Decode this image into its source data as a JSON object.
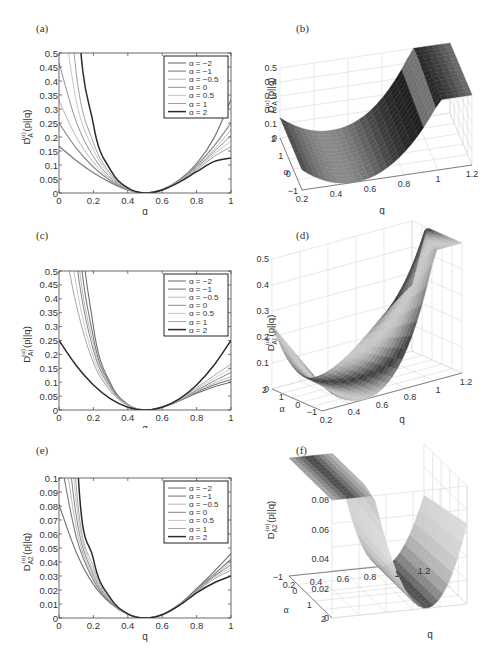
{
  "panels": {
    "a": {
      "label": "(a)",
      "ylabel_main": "D",
      "ylabel_sub": "A",
      "ylabel_sup": "(α)",
      "ylabel_tail": "(p||q)",
      "xlabel": "q"
    },
    "b": {
      "label": "(b)",
      "zlabel_main": "D",
      "zlabel_sub": "A",
      "zlabel_sup": "(α)",
      "zlabel_tail": "(p||q)",
      "xlabel": "q",
      "ylabel": "α"
    },
    "c": {
      "label": "(c)",
      "ylabel_main": "D",
      "ylabel_sub": "AI",
      "ylabel_sup": "(α)",
      "ylabel_tail": "(p||q)",
      "xlabel": "q"
    },
    "d": {
      "label": "(d)",
      "zlabel_main": "D",
      "zlabel_sub": "AI",
      "zlabel_sup": "(α)",
      "zlabel_tail": "(p||q)",
      "xlabel": "q",
      "ylabel": "α"
    },
    "e": {
      "label": "(e)",
      "ylabel_main": "D",
      "ylabel_sub": "A2",
      "ylabel_sup": "(α)",
      "ylabel_tail": "(p||q)",
      "xlabel": "q"
    },
    "f": {
      "label": "(f)",
      "zlabel_main": "D",
      "zlabel_sub": "A2",
      "zlabel_sup": "(α)",
      "zlabel_tail": "(p||q)",
      "xlabel": "q",
      "ylabel": "α"
    }
  },
  "chart_data": [
    {
      "id": "a",
      "type": "line",
      "title": "(a)",
      "xlabel": "q",
      "ylabel": "D_A^(α)(p||q)",
      "xlim": [
        0,
        1
      ],
      "ylim": [
        0,
        0.5
      ],
      "xticks": [
        "0",
        "0.2",
        "0.4",
        "0.6",
        "0.8",
        "1"
      ],
      "yticks": [
        "0",
        "0.05",
        "0.1",
        "0.15",
        "0.2",
        "0.25",
        "0.3",
        "0.35",
        "0.4",
        "0.45",
        "0.5"
      ],
      "grid": false,
      "legend_position": "upper right",
      "x": [
        0,
        0.1,
        0.2,
        0.3,
        0.4,
        0.5,
        0.6,
        0.7,
        0.8,
        0.9,
        1.0
      ],
      "series": [
        {
          "name": "α = −2",
          "color": "#7a7a7a",
          "width": 1.2,
          "values": [
            0.167,
            0.116,
            0.072,
            0.037,
            0.011,
            0,
            0.012,
            0.047,
            0.105,
            0.195,
            0.333
          ]
        },
        {
          "name": "α = −1",
          "color": "#8a8a8a",
          "width": 1.2,
          "values": [
            0.25,
            0.16,
            0.093,
            0.044,
            0.012,
            0,
            0.012,
            0.045,
            0.098,
            0.167,
            0.25
          ]
        },
        {
          "name": "α = −0.5",
          "color": "#b5b5b5",
          "width": 1.0,
          "values": [
            0.33,
            0.2,
            0.11,
            0.05,
            0.013,
            0,
            0.012,
            0.044,
            0.094,
            0.155,
            0.225
          ]
        },
        {
          "name": "α = 0",
          "color": "#8f8f8f",
          "width": 1.0,
          "values": [
            0.465,
            0.255,
            0.13,
            0.055,
            0.014,
            0,
            0.012,
            0.043,
            0.09,
            0.147,
            0.205
          ]
        },
        {
          "name": "α = 0.5",
          "color": "#c4c4c4",
          "width": 1.0,
          "values": [
            0.75,
            0.33,
            0.155,
            0.062,
            0.015,
            0,
            0.012,
            0.042,
            0.086,
            0.139,
            0.185
          ]
        },
        {
          "name": "α = 1",
          "color": "#9e9e9e",
          "width": 1.0,
          "values": [
            1.2,
            0.43,
            0.18,
            0.068,
            0.016,
            0,
            0.011,
            0.041,
            0.082,
            0.13,
            0.165
          ]
        },
        {
          "name": "α = 2",
          "color": "#2a2a2a",
          "width": 1.5,
          "values": [
            3.0,
            0.78,
            0.245,
            0.082,
            0.018,
            0,
            0.011,
            0.039,
            0.076,
            0.112,
            0.125
          ]
        }
      ]
    },
    {
      "id": "b",
      "type": "surface",
      "title": "(b)",
      "xlabel": "q",
      "ylabel": "α",
      "zlabel": "D_A^(α)(p||q)",
      "xticks": [
        "0.2",
        "0.4",
        "0.6",
        "0.8",
        "1",
        "1.2"
      ],
      "yticks": [
        "−1",
        "0",
        "1",
        "2"
      ],
      "zticks": [
        "0",
        "0.1",
        "0.2",
        "0.3",
        "0.4",
        "0.5"
      ],
      "xlim": [
        0.2,
        1.2
      ],
      "ylim": [
        -1,
        2
      ],
      "zlim": [
        0,
        0.5
      ]
    },
    {
      "id": "c",
      "type": "line",
      "title": "(c)",
      "xlabel": "q",
      "ylabel": "D_AI^(α)(p||q)",
      "xlim": [
        0,
        1
      ],
      "ylim": [
        0,
        0.5
      ],
      "xticks": [
        "0",
        "0.2",
        "0.4",
        "0.6",
        "0.8",
        "1"
      ],
      "yticks": [
        "0",
        "0.05",
        "0.1",
        "0.15",
        "0.2",
        "0.25",
        "0.3",
        "0.35",
        "0.4",
        "0.45",
        "0.5"
      ],
      "grid": false,
      "legend_position": "upper right",
      "x": [
        0,
        0.1,
        0.2,
        0.3,
        0.4,
        0.5,
        0.6,
        0.7,
        0.8,
        0.9,
        1.0
      ],
      "series": [
        {
          "name": "α = −2",
          "color": "#6f6f6f",
          "width": 1.1,
          "values": [
            3.0,
            0.95,
            0.3,
            0.095,
            0.02,
            0,
            0.01,
            0.033,
            0.06,
            0.083,
            0.1
          ]
        },
        {
          "name": "α = −1",
          "color": "#7a7a7a",
          "width": 1.1,
          "values": [
            2.2,
            0.75,
            0.26,
            0.088,
            0.019,
            0,
            0.01,
            0.034,
            0.064,
            0.09,
            0.11
          ]
        },
        {
          "name": "α = −0.5",
          "color": "#b8b8b8",
          "width": 1.0,
          "values": [
            1.6,
            0.62,
            0.235,
            0.083,
            0.018,
            0,
            0.011,
            0.035,
            0.067,
            0.096,
            0.12
          ]
        },
        {
          "name": "α = 0",
          "color": "#858585",
          "width": 1.0,
          "values": [
            1.2,
            0.54,
            0.215,
            0.079,
            0.018,
            0,
            0.011,
            0.036,
            0.071,
            0.104,
            0.135
          ]
        },
        {
          "name": "α = 0.5",
          "color": "#c8c8c8",
          "width": 1.0,
          "values": [
            0.9,
            0.45,
            0.19,
            0.073,
            0.017,
            0,
            0.011,
            0.037,
            0.075,
            0.113,
            0.15
          ]
        },
        {
          "name": "α = 1",
          "color": "#a5a5a5",
          "width": 1.0,
          "values": [
            0.7,
            0.38,
            0.17,
            0.067,
            0.016,
            0,
            0.012,
            0.039,
            0.08,
            0.123,
            0.165
          ]
        },
        {
          "name": "α = 2",
          "color": "#2a2a2a",
          "width": 1.5,
          "values": [
            0.25,
            0.16,
            0.09,
            0.04,
            0.01,
            0,
            0.01,
            0.04,
            0.09,
            0.16,
            0.25
          ]
        }
      ]
    },
    {
      "id": "d",
      "type": "surface",
      "title": "(d)",
      "xlabel": "q",
      "ylabel": "α",
      "zlabel": "D_AI^(α)(p||q)",
      "xticks": [
        "0.2",
        "0.4",
        "0.6",
        "0.8",
        "1",
        "1.2"
      ],
      "yticks": [
        "−1",
        "0",
        "1",
        "2"
      ],
      "zticks": [
        "0",
        "0.1",
        "0.2",
        "0.3",
        "0.4",
        "0.5"
      ],
      "xlim": [
        0.2,
        1.2
      ],
      "ylim": [
        -1,
        2
      ],
      "zlim": [
        0,
        0.5
      ]
    },
    {
      "id": "e",
      "type": "line",
      "title": "(e)",
      "xlabel": "q",
      "ylabel": "D_A2^(α)(p||q)",
      "xlim": [
        0,
        1
      ],
      "ylim": [
        0,
        0.1
      ],
      "xticks": [
        "0",
        "0.2",
        "0.4",
        "0.6",
        "0.8",
        "1"
      ],
      "yticks": [
        "0",
        "0.01",
        "0.02",
        "0.03",
        "0.04",
        "0.05",
        "0.06",
        "0.07",
        "0.08",
        "0.09",
        "0.1"
      ],
      "grid": false,
      "legend_position": "upper right",
      "x": [
        0,
        0.1,
        0.2,
        0.3,
        0.4,
        0.5,
        0.6,
        0.7,
        0.8,
        0.9,
        1.0
      ],
      "series": [
        {
          "name": "α = −2",
          "color": "#6f6f6f",
          "width": 1.1,
          "values": [
            0.081,
            0.047,
            0.024,
            0.0105,
            0.0027,
            0,
            0.0025,
            0.0098,
            0.021,
            0.033,
            0.046
          ]
        },
        {
          "name": "α = −1",
          "color": "#7a7a7a",
          "width": 1.1,
          "values": [
            0.12,
            0.058,
            0.027,
            0.011,
            0.0027,
            0,
            0.0025,
            0.0096,
            0.02,
            0.031,
            0.042
          ]
        },
        {
          "name": "α = −0.5",
          "color": "#b8b8b8",
          "width": 1.0,
          "values": [
            0.15,
            0.065,
            0.029,
            0.0115,
            0.0028,
            0,
            0.0025,
            0.0095,
            0.0198,
            0.03,
            0.04
          ]
        },
        {
          "name": "α = 0",
          "color": "#858585",
          "width": 1.0,
          "values": [
            0.19,
            0.073,
            0.031,
            0.012,
            0.0028,
            0,
            0.0024,
            0.0094,
            0.0195,
            0.0295,
            0.038
          ]
        },
        {
          "name": "α = 0.5",
          "color": "#c8c8c8",
          "width": 1.0,
          "values": [
            0.25,
            0.083,
            0.033,
            0.0125,
            0.0029,
            0,
            0.0024,
            0.0093,
            0.019,
            0.0288,
            0.036
          ]
        },
        {
          "name": "α = 1",
          "color": "#a5a5a5",
          "width": 1.0,
          "values": [
            0.34,
            0.095,
            0.036,
            0.013,
            0.0029,
            0,
            0.0024,
            0.0092,
            0.0186,
            0.0278,
            0.034
          ]
        },
        {
          "name": "α = 2",
          "color": "#2a2a2a",
          "width": 1.5,
          "values": [
            0.6,
            0.13,
            0.042,
            0.014,
            0.003,
            0,
            0.0023,
            0.009,
            0.018,
            0.025,
            0.03
          ]
        }
      ]
    },
    {
      "id": "f",
      "type": "surface",
      "title": "(f)",
      "xlabel": "q",
      "ylabel": "α",
      "zlabel": "D_A2^(α)(p||q)",
      "xticks": [
        "1.2",
        "1",
        "0.8",
        "0.6",
        "0.4",
        "0.2"
      ],
      "yticks": [
        "−1",
        "0",
        "1",
        "2"
      ],
      "zticks": [
        "0",
        "0.02",
        "0.04",
        "0.06",
        "0.08"
      ],
      "xlim": [
        0.2,
        1.2
      ],
      "ylim": [
        -1,
        2
      ],
      "zlim": [
        0,
        0.08
      ]
    }
  ]
}
